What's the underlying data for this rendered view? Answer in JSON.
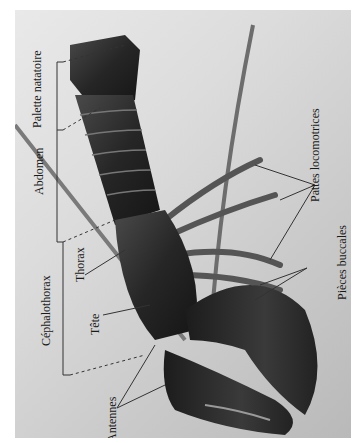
{
  "figure": {
    "labels": {
      "palette": "Palette natatoire",
      "abdomen": "Abdomen",
      "cephalothorax": "Céphalothorax",
      "thorax": "Thorax",
      "tete": "Tête",
      "antennes": "Antennes",
      "pattes": "Pattes locomotrices",
      "pieces": "Pièces buccales"
    },
    "colors": {
      "background_light": "#e9e9e9",
      "background_dark": "#b9b9b9",
      "body": "#2a2a2a",
      "line": "#333333"
    }
  }
}
